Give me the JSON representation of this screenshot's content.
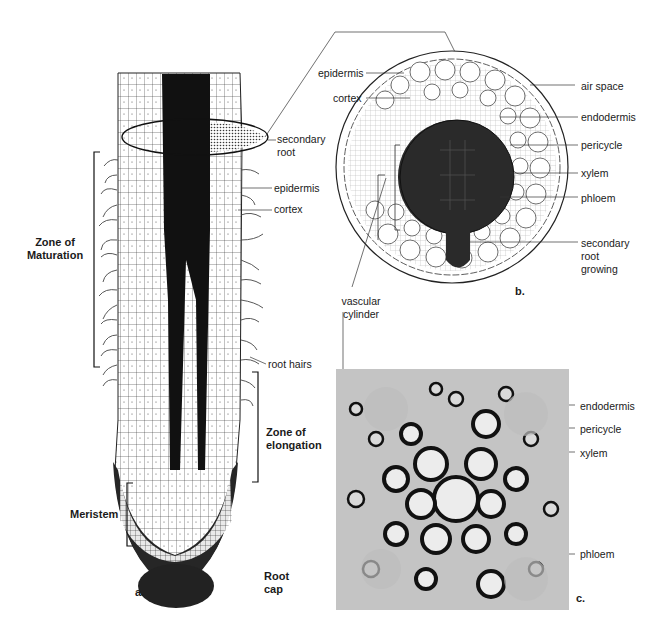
{
  "figure": {
    "panels": [
      {
        "id": "a",
        "panel_label": "a.",
        "description": "Longitudinal section of root tip",
        "zones": {
          "maturation": "Zone of Maturation",
          "elongation": "Zone of elongation",
          "meristem": "Meristem",
          "root_cap": "Root cap"
        },
        "labels": {
          "secondary_root": "secondary root",
          "epidermis": "epidermis",
          "cortex": "cortex",
          "root_hairs": "root hairs"
        }
      },
      {
        "id": "b",
        "panel_label": "b.",
        "description": "Cross section through zone of maturation",
        "labels": {
          "epidermis": "epidermis",
          "cortex": "cortex",
          "air_space": "air space",
          "endodermis": "endodermis",
          "pericycle": "pericycle",
          "xylem": "xylem",
          "phloem": "phloem",
          "secondary_root_growing": "secondary root growing",
          "vascular_cylinder": "vascular cylinder"
        }
      },
      {
        "id": "c",
        "panel_label": "c.",
        "description": "Micrograph of vascular cylinder",
        "labels": {
          "endodermis": "endodermis",
          "pericycle": "pericycle",
          "xylem": "xylem",
          "phloem": "phloem"
        }
      }
    ],
    "colors": {
      "ink": "#111111",
      "cell_fill": "#ffffff",
      "stele_dark": "#2a2a2a",
      "photo_bg": "#bdbdbd"
    }
  }
}
